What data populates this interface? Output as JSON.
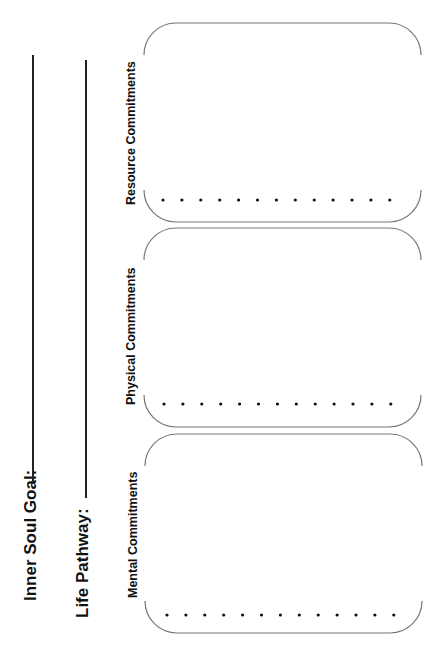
{
  "worksheet": {
    "fields": [
      {
        "label": "Inner Soul Goal:",
        "value": ""
      },
      {
        "label": "Life Pathway:",
        "value": ""
      }
    ],
    "sections": [
      {
        "title": "Resource Commitments",
        "bullet_count": 13
      },
      {
        "title": "Physical Commitments",
        "bullet_count": 13
      },
      {
        "title": "Mental Commitments",
        "bullet_count": 13
      }
    ]
  }
}
